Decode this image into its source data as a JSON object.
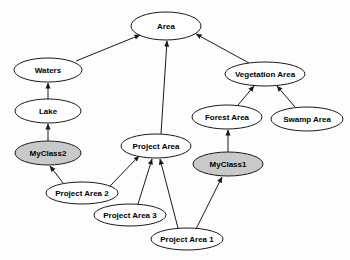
{
  "diagram": {
    "type": "uml-generalization-graph",
    "background_color": "#fdfdfd",
    "stroke_color": "#1a1a1a",
    "plain_fill": "#ffffff",
    "shaded_fill": "#c9c9c9",
    "nodes": [
      {
        "id": "area",
        "label": "Area",
        "cx": 166,
        "cy": 26,
        "rx": 35,
        "ry": 14,
        "shaded": false
      },
      {
        "id": "waters",
        "label": "Waters",
        "cx": 48,
        "cy": 70,
        "rx": 34,
        "ry": 12,
        "shaded": false
      },
      {
        "id": "lake",
        "label": "Lake",
        "cx": 48,
        "cy": 111,
        "rx": 33,
        "ry": 12,
        "shaded": false
      },
      {
        "id": "myclass2",
        "label": "MyClass2",
        "cx": 48,
        "cy": 153,
        "rx": 33,
        "ry": 12,
        "shaded": true
      },
      {
        "id": "vegetation-area",
        "label": "Vegetation Area",
        "cx": 265,
        "cy": 74,
        "rx": 40,
        "ry": 12,
        "shaded": false
      },
      {
        "id": "forest-area",
        "label": "Forest Area",
        "cx": 227,
        "cy": 117,
        "rx": 35,
        "ry": 12,
        "shaded": false
      },
      {
        "id": "swamp-area",
        "label": "Swamp Area",
        "cx": 307,
        "cy": 119,
        "rx": 36,
        "ry": 12,
        "shaded": false
      },
      {
        "id": "myclass1",
        "label": "MyClass1",
        "cx": 228,
        "cy": 164,
        "rx": 35,
        "ry": 12,
        "shaded": true
      },
      {
        "id": "project-area",
        "label": "Project Area",
        "cx": 156,
        "cy": 146,
        "rx": 35,
        "ry": 12,
        "shaded": false
      },
      {
        "id": "project-area-2",
        "label": "Project Area 2",
        "cx": 82,
        "cy": 193,
        "rx": 36,
        "ry": 11,
        "shaded": false
      },
      {
        "id": "project-area-3",
        "label": "Project Area 3",
        "cx": 130,
        "cy": 215,
        "rx": 36,
        "ry": 11,
        "shaded": false
      },
      {
        "id": "project-area-1",
        "label": "Project Area 1",
        "cx": 187,
        "cy": 239,
        "rx": 36,
        "ry": 11,
        "shaded": false
      }
    ],
    "edges": [
      {
        "id": "waters-to-area",
        "from": "waters",
        "to": "area",
        "x1": 76,
        "y1": 61,
        "x2": 140,
        "y2": 35
      },
      {
        "id": "lake-to-waters",
        "from": "lake",
        "to": "waters",
        "x1": 48,
        "y1": 99,
        "x2": 48,
        "y2": 83
      },
      {
        "id": "myclass2-to-lake",
        "from": "myclass2",
        "to": "lake",
        "x1": 48,
        "y1": 141,
        "x2": 48,
        "y2": 124
      },
      {
        "id": "projectarea-to-area",
        "from": "project-area",
        "to": "area",
        "x1": 161,
        "y1": 134,
        "x2": 167,
        "y2": 41
      },
      {
        "id": "vegetation-to-area",
        "from": "vegetation-area",
        "to": "area",
        "x1": 249,
        "y1": 63,
        "x2": 196,
        "y2": 34
      },
      {
        "id": "forest-to-vegetation",
        "from": "forest-area",
        "to": "vegetation-area",
        "x1": 238,
        "y1": 105,
        "x2": 254,
        "y2": 86
      },
      {
        "id": "swamp-to-vegetation",
        "from": "swamp-area",
        "to": "vegetation-area",
        "x1": 295,
        "y1": 107,
        "x2": 277,
        "y2": 86
      },
      {
        "id": "myclass1-to-forest",
        "from": "myclass1",
        "to": "forest-area",
        "x1": 228,
        "y1": 152,
        "x2": 228,
        "y2": 130
      },
      {
        "id": "projectarea2-to-myclass2",
        "from": "project-area-2",
        "to": "myclass2",
        "x1": 63,
        "y1": 183,
        "x2": 50,
        "y2": 166
      },
      {
        "id": "projectarea2-to-projarea",
        "from": "project-area-2",
        "to": "project-area",
        "x1": 110,
        "y1": 186,
        "x2": 139,
        "y2": 156
      },
      {
        "id": "projectarea3-to-projarea",
        "from": "project-area-3",
        "to": "project-area",
        "x1": 138,
        "y1": 204,
        "x2": 152,
        "y2": 159
      },
      {
        "id": "projectarea1-to-projarea",
        "from": "project-area-1",
        "to": "project-area",
        "x1": 178,
        "y1": 228,
        "x2": 160,
        "y2": 159
      },
      {
        "id": "projectarea1-to-myclass1",
        "from": "project-area-1",
        "to": "myclass1",
        "x1": 196,
        "y1": 229,
        "x2": 222,
        "y2": 177
      }
    ]
  }
}
